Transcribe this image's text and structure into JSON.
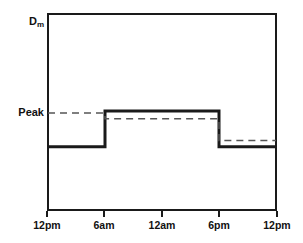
{
  "chart_data": {
    "type": "line",
    "title": "",
    "xlabel": "",
    "ylabel": "",
    "grid": false,
    "legend": "none",
    "x_tick_labels": [
      "12pm",
      "6am",
      "12am",
      "6pm",
      "12pm"
    ],
    "x_tick_positions": [
      0,
      6,
      12,
      18,
      24
    ],
    "y_tick_labels": [
      "D",
      "Peak"
    ],
    "y_axis_top_label": "Dm",
    "y_axis_top_label_base": "D",
    "y_axis_top_label_sub": "m",
    "y_axis_peak_label": "Peak",
    "xlim": [
      0,
      24
    ],
    "ylim": [
      0,
      1
    ],
    "series": [
      {
        "name": "actual-demand-step",
        "style": "solid",
        "color": "#1a1a1a",
        "width": 3,
        "type": "step",
        "points": [
          {
            "x": 0,
            "y": 0.323
          },
          {
            "x": 6,
            "y": 0.323
          },
          {
            "x": 6,
            "y": 0.505
          },
          {
            "x": 18,
            "y": 0.505
          },
          {
            "x": 18,
            "y": 0.323
          },
          {
            "x": 24,
            "y": 0.323
          }
        ]
      },
      {
        "name": "peak-reference-step",
        "style": "dashed",
        "color": "#555555",
        "width": 1.5,
        "type": "step",
        "points": [
          {
            "x": 0,
            "y": 0.495
          },
          {
            "x": 6,
            "y": 0.495
          },
          {
            "x": 6,
            "y": 0.465
          },
          {
            "x": 18,
            "y": 0.465
          },
          {
            "x": 18,
            "y": 0.354
          },
          {
            "x": 24,
            "y": 0.354
          }
        ]
      }
    ],
    "annotations": [
      {
        "name": "peak-level-marker",
        "label": "Peak",
        "y": 0.495
      },
      {
        "name": "max-demand-marker",
        "label": "Dm",
        "y": 1.0
      }
    ]
  }
}
